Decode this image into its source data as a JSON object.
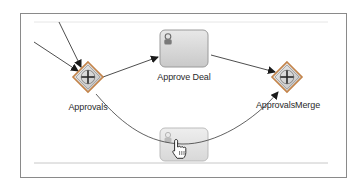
{
  "diagram": {
    "type": "bpmn-process",
    "colors": {
      "frame_border": "#8a8a8a",
      "edge": "#3a3a3a",
      "task_fill": "#d6d6d6",
      "task_border": "#9a9a9a",
      "gateway_fill": "#d9d9d9",
      "gateway_border": "#8c8c8c",
      "gateway_outline": "#c4844a"
    },
    "nodes": [
      {
        "id": "approvals",
        "kind": "parallel-gateway",
        "label": "Approvals"
      },
      {
        "id": "approve-deal",
        "kind": "user-task",
        "label": "Approve Deal"
      },
      {
        "id": "task-2",
        "kind": "user-task",
        "label": ""
      },
      {
        "id": "approvals-merge",
        "kind": "parallel-gateway",
        "label": "ApprovalsMerge"
      }
    ],
    "edges": [
      {
        "from": "incoming-1",
        "to": "approvals"
      },
      {
        "from": "incoming-2",
        "to": "approvals"
      },
      {
        "from": "approvals",
        "to": "approve-deal"
      },
      {
        "from": "approve-deal",
        "to": "approvals-merge"
      },
      {
        "from": "approvals",
        "to": "approvals-merge",
        "via": "curved path through task-2"
      }
    ],
    "cursor": "hand-pointer"
  }
}
